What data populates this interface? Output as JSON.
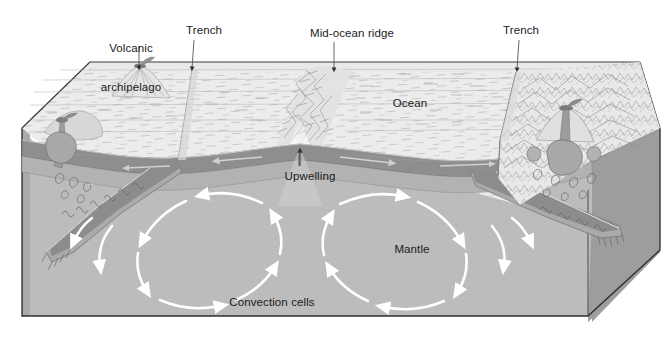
{
  "figure": {
    "type": "geological-cross-section-diagram",
    "width": 666,
    "height": 344,
    "background": "#ffffff"
  },
  "labels": {
    "volcanic_archipelago_line1": "Volcanic",
    "volcanic_archipelago_line2": "archipelago",
    "trench_left": "Trench",
    "mid_ocean_ridge": "Mid-ocean ridge",
    "trench_right": "Trench",
    "ocean": "Ocean",
    "upwelling": "Upwelling",
    "mantle": "Mantle",
    "convection_cells": "Convection cells"
  },
  "label_positions": {
    "volcanic_archipelago": {
      "x": 131,
      "y": 18,
      "leader_x": 139,
      "leader_y1": 46,
      "leader_y2": 69
    },
    "trench_left": {
      "x": 204,
      "y": 25,
      "leader_x": 192,
      "leader_y1": 40,
      "leader_y2": 70
    },
    "mid_ocean_ridge": {
      "x": 352,
      "y": 28,
      "leader_x": 333,
      "leader_y1": 42,
      "leader_y2": 72
    },
    "trench_right": {
      "x": 521,
      "y": 25,
      "leader_x": 516,
      "leader_y1": 40,
      "leader_y2": 72
    },
    "ocean": {
      "x": 410,
      "y": 98
    },
    "upwelling": {
      "x": 310,
      "y": 172,
      "leader_x": 299,
      "leader_y1": 147,
      "leader_y2": 166
    },
    "mantle": {
      "x": 412,
      "y": 245
    },
    "convection_cells": {
      "x": 272,
      "y": 298
    }
  },
  "colors": {
    "ocean_surface": "#ececec",
    "ocean_surface_alt": "#e4e4e4",
    "crust_dark": "#8e8e8e",
    "crust_mid": "#a6a6a6",
    "lithosphere_slab": "#b0b0b0",
    "mantle_fill": "#bcbcbc",
    "mantle_side_wall": "#9d9d9d",
    "front_face": "#b4b4b4",
    "outline": "#3a3a3a",
    "hatch_line": "#9a9a9a",
    "arrow_white": "#ffffff",
    "label_text": "#1a1a1a",
    "leader_line": "#555555",
    "volcano_cone": "#8a8a8a",
    "magma": "#a0a0a0"
  },
  "features": {
    "blocks": [
      {
        "name": "ocean-floor-top-surface",
        "description": "Light gray stippled seafloor plane in perspective"
      },
      {
        "name": "mantle-front-face",
        "description": "Large gray mantle body below lithosphere"
      },
      {
        "name": "mantle-right-wall",
        "description": "Darker gray right side wall of block"
      },
      {
        "name": "mantle-left-wall",
        "description": "Darker gray left side wall of block"
      }
    ],
    "tectonic_elements": [
      {
        "name": "mid-ocean-ridge",
        "x": 300,
        "y": 140,
        "description": "Spreading center with upwelling magma"
      },
      {
        "name": "subduction-zone-left",
        "x": 190,
        "y": 150,
        "description": "Trench with descending slab dipping left"
      },
      {
        "name": "subduction-zone-right",
        "x": 515,
        "y": 150,
        "description": "Trench with descending slab dipping right"
      },
      {
        "name": "volcanic-arc-left",
        "x": 140,
        "y": 75,
        "description": "Volcanic archipelago above left subduction zone"
      },
      {
        "name": "volcanic-arc-right",
        "x": 565,
        "y": 110,
        "description": "Continental arc volcano above right subduction zone"
      }
    ],
    "convection_cells": [
      {
        "name": "left-convection-cell",
        "cx": 175,
        "cy": 250,
        "rx": 98,
        "ry": 60,
        "rotation": "counterclockwise",
        "arrow_count": 8
      },
      {
        "name": "right-convection-cell",
        "cx": 430,
        "cy": 250,
        "rx": 98,
        "ry": 60,
        "rotation": "clockwise",
        "arrow_count": 8
      }
    ],
    "plate_motion_arrows": [
      {
        "name": "spreading-arrow-left",
        "direction": "left",
        "x": 230,
        "y": 158
      },
      {
        "name": "spreading-arrow-right",
        "direction": "right",
        "x": 380,
        "y": 158
      }
    ]
  }
}
